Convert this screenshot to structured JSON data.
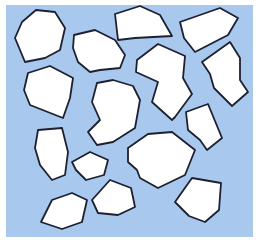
{
  "scene": {
    "description": "Scattered white irregular polygon pieces with dark outlines on a light blue background",
    "background": {
      "color": "#a9c8ee",
      "x": 6,
      "y": 5,
      "width": 247,
      "height": 232
    },
    "page_color": "#ffffff",
    "outline_color": "#1c2030",
    "piece_fill": "#ffffff",
    "pieces": [
      {
        "id": "piece-1",
        "points": "15,38 22,22 36,10 55,12 65,28 60,50 45,58 25,62"
      },
      {
        "id": "piece-2",
        "points": "74,35 95,30 115,40 125,55 120,68 100,70 90,72 78,62 73,48"
      },
      {
        "id": "piece-3",
        "points": "115,14 140,6 160,15 172,36 135,38 118,40"
      },
      {
        "id": "piece-4",
        "points": "180,22 220,8 238,18 228,35 195,52 184,38"
      },
      {
        "id": "piece-5",
        "points": "137,60 158,44 185,56 183,78 192,94 175,117 172,120 152,102 158,82 136,72"
      },
      {
        "id": "piece-6",
        "points": "202,62 230,42 240,58 240,80 248,92 232,106 214,88 210,74"
      },
      {
        "id": "piece-7",
        "points": "28,73 50,66 73,78 70,98 63,118 30,105 24,90"
      },
      {
        "id": "piece-8",
        "points": "97,83 113,80 133,86 140,100 135,128 113,142 97,145 88,132 100,120 92,102"
      },
      {
        "id": "piece-9",
        "points": "186,112 208,104 222,138 207,150 200,140 188,130"
      },
      {
        "id": "piece-10",
        "points": "38,130 62,128 68,152 65,175 52,180 40,165 35,148"
      },
      {
        "id": "piece-11",
        "points": "72,162 90,152 108,160 104,175 86,180 76,170"
      },
      {
        "id": "piece-12",
        "points": "128,148 148,134 172,132 195,150 185,175 158,188 140,178 137,170 128,162"
      },
      {
        "id": "piece-13",
        "points": "92,200 110,180 131,188 135,207 118,215 98,213"
      },
      {
        "id": "piece-14",
        "points": "175,202 192,178 221,183 219,210 205,222 189,216"
      },
      {
        "id": "piece-15",
        "points": "41,222 52,200 72,193 87,200 82,222 62,229"
      }
    ]
  }
}
